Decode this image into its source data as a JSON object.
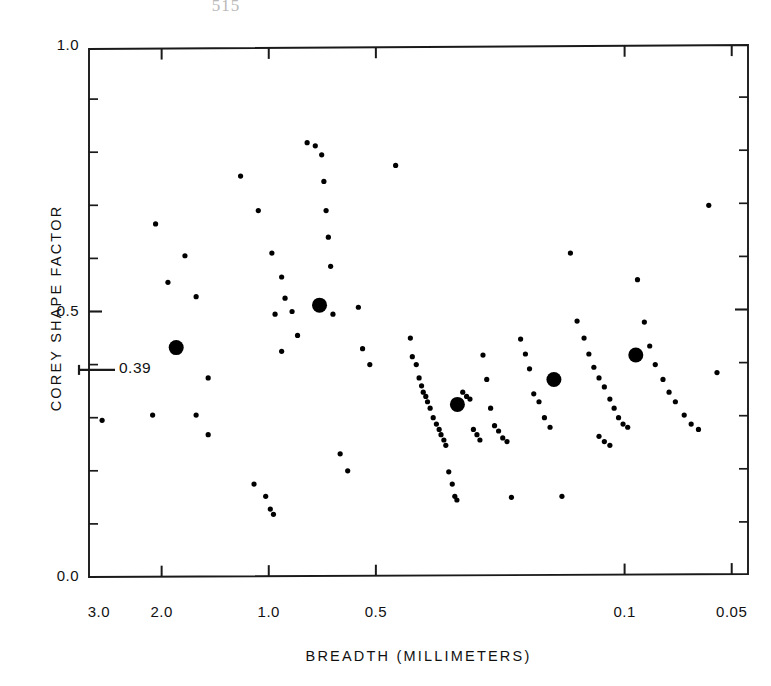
{
  "page": {
    "page_number": "515"
  },
  "chart_data": {
    "type": "scatter",
    "title": "",
    "xlabel": "BREADTH (MILLIMETERS)",
    "ylabel": "COREY SHAPE FACTOR",
    "x_scale": "log-reversed",
    "y_scale": "linear",
    "xlim": [
      3.2,
      0.045
    ],
    "ylim": [
      0.0,
      1.0
    ],
    "grid": false,
    "legend": null,
    "xticks": [
      {
        "value": 3.0,
        "label": "3.0"
      },
      {
        "value": 2.0,
        "label": "2.0"
      },
      {
        "value": 1.0,
        "label": "1.0"
      },
      {
        "value": 0.5,
        "label": "0.5"
      },
      {
        "value": 0.1,
        "label": "0.1"
      },
      {
        "value": 0.05,
        "label": "0.05"
      }
    ],
    "yticks": [
      {
        "value": 0.0,
        "label": "0.0",
        "major": true
      },
      {
        "value": 0.1,
        "label": "",
        "major": false
      },
      {
        "value": 0.2,
        "label": "",
        "major": false
      },
      {
        "value": 0.3,
        "label": "",
        "major": false
      },
      {
        "value": 0.4,
        "label": "",
        "major": false
      },
      {
        "value": 0.5,
        "label": "0.5",
        "major": true
      },
      {
        "value": 0.6,
        "label": "",
        "major": false
      },
      {
        "value": 0.7,
        "label": "",
        "major": false
      },
      {
        "value": 0.8,
        "label": "",
        "major": false
      },
      {
        "value": 0.9,
        "label": "",
        "major": false
      },
      {
        "value": 1.0,
        "label": "1.0",
        "major": true
      }
    ],
    "annotations": [
      {
        "name": "mean-shape-factor",
        "label": "0.39",
        "y_value": 0.39,
        "type": "axis-pointer",
        "side": "left"
      }
    ],
    "series": [
      {
        "name": "individual-samples",
        "marker": "small-dot",
        "marker_radius_px": 2.6,
        "color": "#000000",
        "points": [
          [
            2.08,
            0.665
          ],
          [
            1.72,
            0.605
          ],
          [
            1.92,
            0.555
          ],
          [
            1.6,
            0.528
          ],
          [
            1.48,
            0.375
          ],
          [
            2.94,
            0.295
          ],
          [
            2.12,
            0.305
          ],
          [
            1.6,
            0.305
          ],
          [
            1.48,
            0.268
          ],
          [
            1.2,
            0.755
          ],
          [
            1.07,
            0.69
          ],
          [
            0.98,
            0.61
          ],
          [
            0.92,
            0.565
          ],
          [
            0.9,
            0.525
          ],
          [
            0.96,
            0.495
          ],
          [
            0.86,
            0.5
          ],
          [
            0.83,
            0.455
          ],
          [
            0.92,
            0.425
          ],
          [
            1.1,
            0.175
          ],
          [
            1.02,
            0.152
          ],
          [
            0.99,
            0.128
          ],
          [
            0.97,
            0.118
          ],
          [
            0.78,
            0.818
          ],
          [
            0.74,
            0.812
          ],
          [
            0.71,
            0.795
          ],
          [
            0.7,
            0.745
          ],
          [
            0.69,
            0.69
          ],
          [
            0.68,
            0.64
          ],
          [
            0.67,
            0.585
          ],
          [
            0.66,
            0.495
          ],
          [
            0.63,
            0.232
          ],
          [
            0.6,
            0.2
          ],
          [
            0.56,
            0.508
          ],
          [
            0.545,
            0.43
          ],
          [
            0.52,
            0.4
          ],
          [
            0.44,
            0.775
          ],
          [
            0.4,
            0.45
          ],
          [
            0.395,
            0.415
          ],
          [
            0.385,
            0.4
          ],
          [
            0.378,
            0.375
          ],
          [
            0.372,
            0.36
          ],
          [
            0.368,
            0.348
          ],
          [
            0.362,
            0.34
          ],
          [
            0.358,
            0.33
          ],
          [
            0.352,
            0.318
          ],
          [
            0.345,
            0.3
          ],
          [
            0.338,
            0.288
          ],
          [
            0.332,
            0.278
          ],
          [
            0.328,
            0.268
          ],
          [
            0.322,
            0.258
          ],
          [
            0.318,
            0.248
          ],
          [
            0.312,
            0.198
          ],
          [
            0.305,
            0.175
          ],
          [
            0.3,
            0.152
          ],
          [
            0.296,
            0.145
          ],
          [
            0.285,
            0.348
          ],
          [
            0.278,
            0.34
          ],
          [
            0.272,
            0.335
          ],
          [
            0.266,
            0.278
          ],
          [
            0.26,
            0.268
          ],
          [
            0.255,
            0.258
          ],
          [
            0.25,
            0.418
          ],
          [
            0.244,
            0.372
          ],
          [
            0.238,
            0.318
          ],
          [
            0.232,
            0.285
          ],
          [
            0.226,
            0.275
          ],
          [
            0.22,
            0.262
          ],
          [
            0.214,
            0.255
          ],
          [
            0.208,
            0.15
          ],
          [
            0.196,
            0.448
          ],
          [
            0.19,
            0.42
          ],
          [
            0.185,
            0.392
          ],
          [
            0.18,
            0.345
          ],
          [
            0.174,
            0.33
          ],
          [
            0.168,
            0.3
          ],
          [
            0.162,
            0.282
          ],
          [
            0.15,
            0.152
          ],
          [
            0.142,
            0.61
          ],
          [
            0.136,
            0.482
          ],
          [
            0.13,
            0.45
          ],
          [
            0.126,
            0.42
          ],
          [
            0.122,
            0.395
          ],
          [
            0.118,
            0.375
          ],
          [
            0.114,
            0.358
          ],
          [
            0.11,
            0.335
          ],
          [
            0.107,
            0.318
          ],
          [
            0.104,
            0.3
          ],
          [
            0.101,
            0.288
          ],
          [
            0.098,
            0.282
          ],
          [
            0.118,
            0.265
          ],
          [
            0.114,
            0.255
          ],
          [
            0.11,
            0.248
          ],
          [
            0.092,
            0.56
          ],
          [
            0.088,
            0.48
          ],
          [
            0.085,
            0.435
          ],
          [
            0.082,
            0.4
          ],
          [
            0.078,
            0.372
          ],
          [
            0.075,
            0.348
          ],
          [
            0.072,
            0.33
          ],
          [
            0.068,
            0.305
          ],
          [
            0.065,
            0.288
          ],
          [
            0.062,
            0.278
          ],
          [
            0.058,
            0.7
          ],
          [
            0.055,
            0.385
          ]
        ]
      },
      {
        "name": "group-means",
        "marker": "large-dot",
        "marker_radius_px": 7.5,
        "color": "#000000",
        "points": [
          [
            1.82,
            0.432
          ],
          [
            0.72,
            0.512
          ],
          [
            0.295,
            0.325
          ],
          [
            0.158,
            0.372
          ],
          [
            0.093,
            0.418
          ]
        ]
      }
    ]
  }
}
